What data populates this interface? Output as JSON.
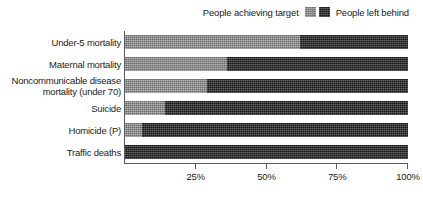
{
  "chart_data": {
    "type": "bar",
    "orientation": "horizontal",
    "stacked": true,
    "normalized_percent": true,
    "title": "",
    "subtitle": "",
    "xlabel": "",
    "ylabel": "",
    "xlim": [
      0,
      100
    ],
    "xticks": [
      "25%",
      "50%",
      "75%",
      "100%"
    ],
    "xtick_values": [
      25,
      50,
      75,
      100
    ],
    "grid": false,
    "legend_position": "top-right",
    "categories": [
      "Under-5 mortality",
      "Maternal mortality",
      "Noncommunicable disease mortality (under 70)",
      "Suicide",
      "Homicide (P)",
      "Traffic deaths"
    ],
    "category_lines": [
      [
        "Under-5 mortality"
      ],
      [
        "Maternal mortality"
      ],
      [
        "Noncommunicable disease",
        "mortality (under 70)"
      ],
      [
        "Suicide"
      ],
      [
        "Homicide (P)"
      ],
      [
        "Traffic deaths"
      ]
    ],
    "series": [
      {
        "name": "People achieving target",
        "color": "#8c8c8c",
        "values": [
          62,
          36,
          29,
          14,
          6,
          0
        ]
      },
      {
        "name": "People left behind",
        "color": "#2b2b2b",
        "values": [
          38,
          64,
          71,
          86,
          94,
          100
        ]
      }
    ]
  },
  "legend": {
    "entries": [
      {
        "label": "People achieving target",
        "swatch": "achieving",
        "order": "label-first"
      },
      {
        "label": "People left behind",
        "swatch": "left-behind",
        "order": "swatch-first"
      }
    ]
  },
  "colors": {
    "achieving_target": "#8c8c8c",
    "left_behind": "#2b2b2b",
    "axis": "#5a5a5a",
    "text": "#1c1c1c",
    "background": "#ffffff"
  }
}
